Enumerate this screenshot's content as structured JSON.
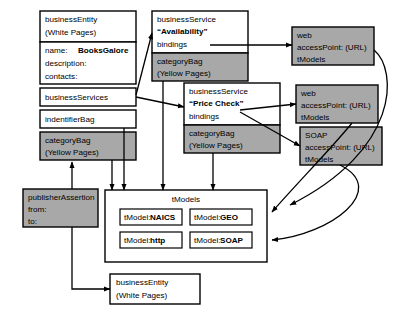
{
  "diagram": {
    "colors": {
      "shaded_fill": "#a8a8a8",
      "plain_fill": "#ffffff",
      "stroke": "#000000"
    },
    "nodes": {
      "business_entity_top": {
        "name": "businessEntity",
        "subtitle": "(White Pages)",
        "fields": [
          {
            "label": "name:",
            "value": "BooksGalore"
          },
          {
            "label": "description:",
            "value": ""
          },
          {
            "label": "contacts:",
            "value": ""
          }
        ]
      },
      "business_services_row": {
        "label": "businessServices"
      },
      "identifier_bag_row": {
        "label": "indentifierBag"
      },
      "category_bag_left": {
        "line1": "categoryBag",
        "line2": "(Yellow Pages)"
      },
      "business_service_availability": {
        "type": "businessService",
        "name": "“Availability”",
        "bindings": "bindings",
        "category_bag_line1": "categoryBag",
        "category_bag_line2": "(Yellow Pages)"
      },
      "business_service_price_check": {
        "type": "businessService",
        "name": "“Price Check”",
        "bindings": "bindings",
        "category_bag_line1": "categoryBag",
        "category_bag_line2": "(Yellow Pages)"
      },
      "binding_web_top": {
        "protocol": "web",
        "access_point": "accessPoint: (URL)",
        "tmodels": "tModels"
      },
      "binding_web_middle": {
        "protocol": "web",
        "access_point": "accessPoint: (URL)",
        "tmodels": "tModels"
      },
      "binding_soap": {
        "protocol": "SOAP",
        "access_point": "accessPoint: (URL)",
        "tmodels": "tModels"
      },
      "publisher_assertion": {
        "title": "publisherAssertion",
        "from": "from:",
        "to": "to:"
      },
      "tmodels_container": {
        "title": "tModels",
        "items": [
          {
            "prefix": "tModel:",
            "name": "NAICS"
          },
          {
            "prefix": "tModel:",
            "name": "GEO"
          },
          {
            "prefix": "tModel:",
            "name": "http"
          },
          {
            "prefix": "tModel:",
            "name": "SOAP"
          }
        ]
      },
      "business_entity_bottom": {
        "name": "businessEntity",
        "subtitle": "(White Pages)"
      }
    }
  }
}
